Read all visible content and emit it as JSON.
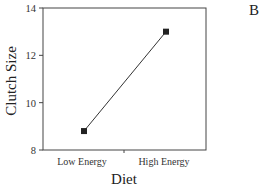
{
  "panel_label": "B",
  "chart_data": {
    "type": "line",
    "title": "",
    "xlabel": "Diet",
    "ylabel": "Clutch Size",
    "categories": [
      "Low Energy",
      "High Energy"
    ],
    "series": [
      {
        "name": "Clutch Size",
        "values": [
          8.8,
          13.0
        ],
        "marker": "square",
        "color": "#222222"
      }
    ],
    "ylim": [
      8,
      14
    ],
    "yticks": [
      8,
      10,
      12,
      14
    ],
    "grid": false,
    "legend": null,
    "frame": "box"
  },
  "layout": {
    "plot_left": 43,
    "plot_right": 206,
    "plot_top": 8,
    "plot_bottom": 150,
    "cat_x": [
      84,
      166
    ],
    "mid_tick_x": 124
  }
}
